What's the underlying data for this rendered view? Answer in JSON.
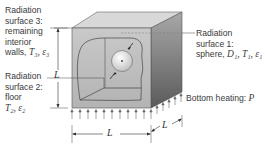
{
  "diagram": {
    "type": "3D cube enclosure with internal sphere (radiation heat transfer)",
    "labels": {
      "surface3": {
        "line1": "Radiation",
        "line2": "surface 3:",
        "line3": "remaining",
        "line4": "interior",
        "line5_text": "walls, ",
        "line5_vars": "T₃, ε₃"
      },
      "surface2": {
        "line1": "Radiation",
        "line2": "surface 2:",
        "line3": "floor",
        "line4_vars": "T₂, ε₂"
      },
      "surface1": {
        "line1": "Radiation",
        "line2": "surface 1:",
        "line3_text": "sphere, ",
        "line3_vars": "D₁, T₁, ε₁"
      },
      "heating": {
        "text": "Bottom heating: ",
        "var": "P"
      }
    },
    "dimensions": {
      "height": "L",
      "width": "L",
      "depth": "L"
    },
    "colors": {
      "front_face": "#bdbdbd",
      "top_face": "#d6d6d6",
      "side_face_light": "#9a9a9a",
      "side_face_dark": "#5e5e5e",
      "outline": "#555555",
      "sphere": "#e4e4e4"
    }
  }
}
